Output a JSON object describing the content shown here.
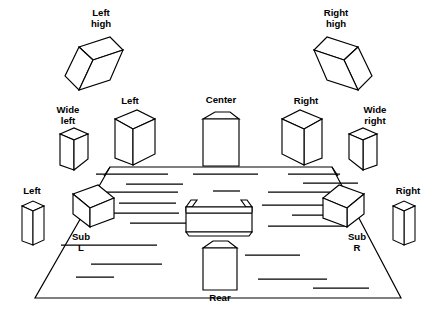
{
  "diagram": {
    "type": "line-drawing",
    "background_color": "#ffffff",
    "line_color": "#000000",
    "labels": {
      "left_high_1": "Left",
      "left_high_2": "high",
      "right_high_1": "Right",
      "right_high_2": "high",
      "wide_left_1": "Wide",
      "wide_left_2": "left",
      "wide_right_1": "Wide",
      "wide_right_2": "right",
      "front_left": "Left",
      "center": "Center",
      "front_right": "Right",
      "surround_left": "Left",
      "surround_right": "Right",
      "sub_left_1": "Sub",
      "sub_left_2": "L",
      "sub_right_1": "Sub",
      "sub_right_2": "R",
      "rear": "Rear"
    },
    "speakers": [
      {
        "id": "left-high",
        "label": "Left high",
        "style": "tilted-box-left"
      },
      {
        "id": "right-high",
        "label": "Right high",
        "style": "tilted-box-right"
      },
      {
        "id": "wide-left",
        "label": "Wide left",
        "style": "small-box-left"
      },
      {
        "id": "front-left",
        "label": "Left",
        "style": "box-left"
      },
      {
        "id": "center",
        "label": "Center",
        "style": "front-box"
      },
      {
        "id": "front-right",
        "label": "Right",
        "style": "box-right"
      },
      {
        "id": "wide-right",
        "label": "Wide right",
        "style": "small-box-right"
      },
      {
        "id": "surround-left",
        "label": "Left",
        "style": "thin-box-left"
      },
      {
        "id": "surround-right",
        "label": "Right",
        "style": "thin-box-right"
      },
      {
        "id": "sub-left",
        "label": "Sub L",
        "style": "floor-box-left"
      },
      {
        "id": "sub-right",
        "label": "Sub R",
        "style": "floor-box-right"
      },
      {
        "id": "rear",
        "label": "Rear",
        "style": "front-box"
      }
    ],
    "furniture": [
      {
        "id": "sofa",
        "label": "",
        "style": "couch-rear-view"
      }
    ],
    "room": {
      "shape": "trapezoid-floor",
      "texture": "carpet-dashes"
    }
  }
}
